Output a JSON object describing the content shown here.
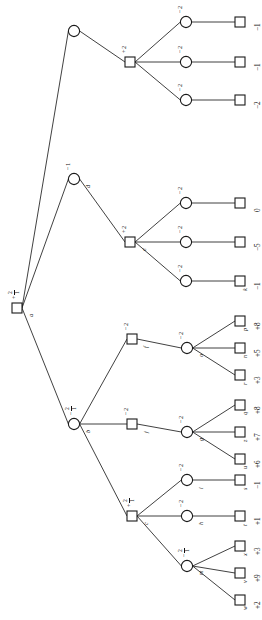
{
  "diagram": {
    "orientation": "rotated-90",
    "colors": {
      "stroke": "#1a1a1a",
      "edge": "#2b2b2b",
      "background": "#ffffff"
    }
  },
  "nodes": [
    {
      "id": "a",
      "shape": "square",
      "name": "a",
      "prob_sign": "+",
      "prob_num": "2",
      "prob_den": "1",
      "x": 17,
      "y": 308
    },
    {
      "id": "n1",
      "shape": "circle",
      "name": "",
      "prob_sign": "",
      "prob_num": "",
      "prob_den": "",
      "x": 74,
      "y": 31
    },
    {
      "id": "n2",
      "shape": "square",
      "name": "",
      "prob_sign": "+",
      "prob_num": "2",
      "prob_den": "",
      "x": 130,
      "y": 62
    },
    {
      "id": "n3",
      "shape": "circle",
      "name": "",
      "prob_sign": "−",
      "prob_num": "2",
      "prob_den": "",
      "x": 186,
      "y": 22
    },
    {
      "id": "n4",
      "shape": "circle",
      "name": "",
      "prob_sign": "−",
      "prob_num": "2",
      "prob_den": "",
      "x": 186,
      "y": 62
    },
    {
      "id": "n5",
      "shape": "circle",
      "name": "",
      "prob_sign": "−",
      "prob_num": "2",
      "prob_den": "",
      "x": 186,
      "y": 100
    },
    {
      "id": "d",
      "shape": "circle",
      "name": "d",
      "prob_sign": "−",
      "prob_num": "1",
      "prob_den": "",
      "x": 74,
      "y": 179
    },
    {
      "id": "e",
      "shape": "square",
      "name": "e",
      "prob_sign": "+",
      "prob_num": "2",
      "prob_den": "",
      "x": 130,
      "y": 242
    },
    {
      "id": "n6",
      "shape": "circle",
      "name": "",
      "prob_sign": "−",
      "prob_num": "2",
      "prob_den": "",
      "x": 186,
      "y": 203
    },
    {
      "id": "n7",
      "shape": "circle",
      "name": "",
      "prob_sign": "−",
      "prob_num": "2",
      "prob_den": "",
      "x": 186,
      "y": 242
    },
    {
      "id": "n8",
      "shape": "circle",
      "name": "",
      "prob_sign": "−",
      "prob_num": "2",
      "prob_den": "",
      "x": 186,
      "y": 281
    },
    {
      "id": "b",
      "shape": "circle",
      "name": "b",
      "prob_sign": "−",
      "prob_num": "2",
      "prob_den": "1",
      "x": 74,
      "y": 424
    },
    {
      "id": "f",
      "shape": "square",
      "name": "f",
      "prob_sign": "−",
      "prob_num": "2",
      "prob_den": "",
      "x": 132,
      "y": 339
    },
    {
      "id": "o",
      "shape": "circle",
      "name": "o",
      "prob_sign": "−",
      "prob_num": "2",
      "prob_den": "",
      "x": 187,
      "y": 348
    },
    {
      "id": "j",
      "shape": "square",
      "name": "j",
      "prob_sign": "−",
      "prob_num": "2",
      "prob_den": "",
      "x": 132,
      "y": 424
    },
    {
      "id": "g",
      "shape": "circle",
      "name": "g",
      "prob_sign": "−",
      "prob_num": "2",
      "prob_den": "",
      "x": 187,
      "y": 432
    },
    {
      "id": "c",
      "shape": "square",
      "name": "c",
      "prob_sign": "+",
      "prob_num": "2",
      "prob_den": "1",
      "x": 132,
      "y": 516
    },
    {
      "id": "i",
      "shape": "circle",
      "name": "i",
      "prob_sign": "−",
      "prob_num": "2",
      "prob_den": "",
      "x": 187,
      "y": 480
    },
    {
      "id": "h",
      "shape": "circle",
      "name": "h",
      "prob_sign": "−",
      "prob_num": "2",
      "prob_den": "",
      "x": 187,
      "y": 516
    },
    {
      "id": "m",
      "shape": "circle",
      "name": "m",
      "prob_sign": "−",
      "prob_num": "2",
      "prob_den": "1",
      "x": 187,
      "y": 566
    }
  ],
  "leaves": [
    {
      "id": "L1",
      "name": "",
      "sign": "−",
      "value": "1",
      "x": 240,
      "y": 22
    },
    {
      "id": "L2",
      "name": "",
      "sign": "−",
      "value": "1",
      "x": 240,
      "y": 62
    },
    {
      "id": "L3",
      "name": "",
      "sign": "−",
      "value": "2",
      "x": 240,
      "y": 100
    },
    {
      "id": "L4",
      "name": "",
      "sign": "",
      "value": "0",
      "x": 240,
      "y": 203
    },
    {
      "id": "L5",
      "name": "",
      "sign": "−",
      "value": "5",
      "x": 240,
      "y": 242
    },
    {
      "id": "L6",
      "name": "k",
      "sign": "−",
      "value": "1",
      "x": 240,
      "y": 281
    },
    {
      "id": "L7",
      "name": "p",
      "sign": "+",
      "value": "8",
      "x": 240,
      "y": 321
    },
    {
      "id": "L8",
      "name": "n",
      "sign": "+",
      "value": "5",
      "x": 240,
      "y": 348
    },
    {
      "id": "L9",
      "name": "r",
      "sign": "+",
      "value": "3",
      "x": 240,
      "y": 375
    },
    {
      "id": "L10",
      "name": "q",
      "sign": "+",
      "value": "8",
      "x": 240,
      "y": 405
    },
    {
      "id": "L11",
      "name": "z",
      "sign": "+",
      "value": "7",
      "x": 240,
      "y": 432
    },
    {
      "id": "L12",
      "name": "u",
      "sign": "+",
      "value": "6",
      "x": 240,
      "y": 459
    },
    {
      "id": "L13",
      "name": "s",
      "sign": "−",
      "value": "1",
      "x": 240,
      "y": 480
    },
    {
      "id": "L14",
      "name": "t",
      "sign": "+",
      "value": "1",
      "x": 240,
      "y": 516
    },
    {
      "id": "L15",
      "name": "x",
      "sign": "+",
      "value": "3",
      "x": 240,
      "y": 546
    },
    {
      "id": "L16",
      "name": "v",
      "sign": "+",
      "value": "9",
      "x": 240,
      "y": 573
    },
    {
      "id": "L17",
      "name": "w",
      "sign": "+",
      "value": "2",
      "x": 240,
      "y": 600
    }
  ],
  "edges": [
    {
      "from": "a",
      "to": "n1"
    },
    {
      "from": "a",
      "to": "d"
    },
    {
      "from": "a",
      "to": "b"
    },
    {
      "from": "n1",
      "to": "n2"
    },
    {
      "from": "n2",
      "to": "n3"
    },
    {
      "from": "n2",
      "to": "n4"
    },
    {
      "from": "n2",
      "to": "n5"
    },
    {
      "from": "n3",
      "to": "L1"
    },
    {
      "from": "n4",
      "to": "L2"
    },
    {
      "from": "n5",
      "to": "L3"
    },
    {
      "from": "d",
      "to": "e"
    },
    {
      "from": "e",
      "to": "n6"
    },
    {
      "from": "e",
      "to": "n7"
    },
    {
      "from": "e",
      "to": "n8"
    },
    {
      "from": "n6",
      "to": "L4"
    },
    {
      "from": "n7",
      "to": "L5"
    },
    {
      "from": "n8",
      "to": "L6"
    },
    {
      "from": "b",
      "to": "f"
    },
    {
      "from": "b",
      "to": "j"
    },
    {
      "from": "b",
      "to": "c"
    },
    {
      "from": "f",
      "to": "o"
    },
    {
      "from": "o",
      "to": "L7"
    },
    {
      "from": "o",
      "to": "L8"
    },
    {
      "from": "o",
      "to": "L9"
    },
    {
      "from": "j",
      "to": "g"
    },
    {
      "from": "g",
      "to": "L10"
    },
    {
      "from": "g",
      "to": "L11"
    },
    {
      "from": "g",
      "to": "L12"
    },
    {
      "from": "c",
      "to": "i"
    },
    {
      "from": "c",
      "to": "h"
    },
    {
      "from": "c",
      "to": "m"
    },
    {
      "from": "i",
      "to": "L13"
    },
    {
      "from": "h",
      "to": "L14"
    },
    {
      "from": "m",
      "to": "L15"
    },
    {
      "from": "m",
      "to": "L16"
    },
    {
      "from": "m",
      "to": "L17"
    }
  ]
}
